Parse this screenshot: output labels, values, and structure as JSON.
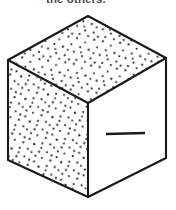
{
  "figure": {
    "kind": "line-drawing",
    "caption": "the others.",
    "caption_clipped": true,
    "background_color": "#ffffff",
    "ink_color": "#1a1a1a",
    "stipple_color": "#2b2b2b",
    "faces": [
      {
        "name": "top-face",
        "fill": "stipple",
        "fill_color": "#ffffff",
        "label": "top face"
      },
      {
        "name": "left-face",
        "fill": "stipple",
        "fill_color": "#ffffff",
        "label": "left face"
      },
      {
        "name": "right-face",
        "fill": "blank",
        "fill_color": "#ffffff",
        "label": "right face",
        "mark": "single horizontal dash"
      }
    ],
    "geometry": {
      "apex_top": "88,16",
      "corner_left_top": "8,60",
      "corner_right_top": "166,58",
      "center_vertex": "88,103",
      "corner_left_bottom": "8,160",
      "corner_right_bottom": "166,158",
      "apex_bottom": "88,197",
      "dash_start": "106,134",
      "dash_end": "145,133"
    },
    "stroke_width": 2.1,
    "stipple_dot_size": 1.15
  }
}
